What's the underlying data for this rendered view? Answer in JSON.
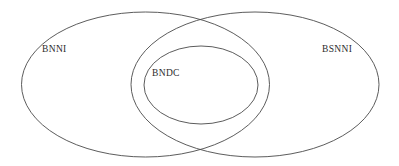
{
  "diagram": {
    "type": "venn",
    "title": "",
    "background_color": "#ffffff",
    "stroke_color": "#4a4a4a",
    "text_color": "#2b2b2b",
    "sets": [
      {
        "id": "left-set",
        "label": "BNNI",
        "shape": "ellipse",
        "cx": 145.5,
        "cy": 84.5,
        "rx": 124,
        "ry": 72.5,
        "label_x": 42,
        "label_y": 45
      },
      {
        "id": "right-set",
        "label": "BSNNI",
        "shape": "ellipse",
        "cx": 255,
        "cy": 84.5,
        "rx": 124,
        "ry": 72.5,
        "label_x": 322,
        "label_y": 45
      },
      {
        "id": "center-set",
        "label": "BNDC",
        "shape": "ellipse",
        "cx": 201,
        "cy": 85,
        "rx": 57,
        "ry": 39,
        "label_x": 152,
        "label_y": 69
      }
    ],
    "intersection_points": [
      {
        "x": 200,
        "y": 20
      },
      {
        "x": 200,
        "y": 148
      }
    ]
  }
}
